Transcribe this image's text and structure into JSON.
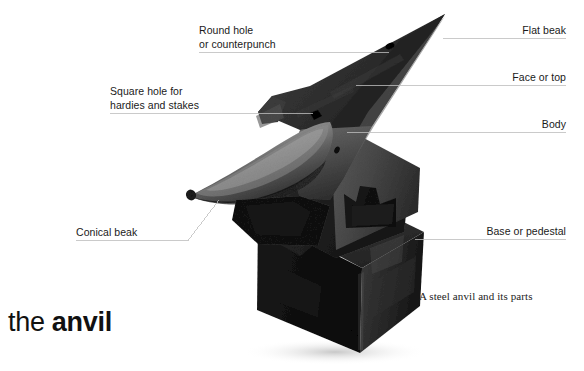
{
  "figure": {
    "title_prefix": "the ",
    "title_word": "anvil",
    "caption": "A steel anvil and its parts",
    "background_color": "#ffffff",
    "leader_line_color": "#b9b9b9",
    "text_color": "#1a1a1a",
    "anvil_body_color": "#3a3a3a",
    "anvil_face_color": "#2a2a2a",
    "base_color": "#171717"
  },
  "callouts": [
    {
      "name": "round-hole",
      "line1": "Round hole",
      "line2": "or counterpunch",
      "align": "left"
    },
    {
      "name": "square-hole",
      "line1": "Square hole for",
      "line2": "hardies and stakes",
      "align": "left"
    },
    {
      "name": "conical-beak",
      "line1": "Conical beak",
      "line2": "",
      "align": "left"
    },
    {
      "name": "flat-beak",
      "line1": "Flat beak",
      "line2": "",
      "align": "right"
    },
    {
      "name": "face-or-top",
      "line1": "Face or top",
      "line2": "",
      "align": "right"
    },
    {
      "name": "body",
      "line1": "Body",
      "line2": "",
      "align": "right"
    },
    {
      "name": "base-or-pedestal",
      "line1": "Base or pedestal",
      "line2": "",
      "align": "right"
    }
  ]
}
